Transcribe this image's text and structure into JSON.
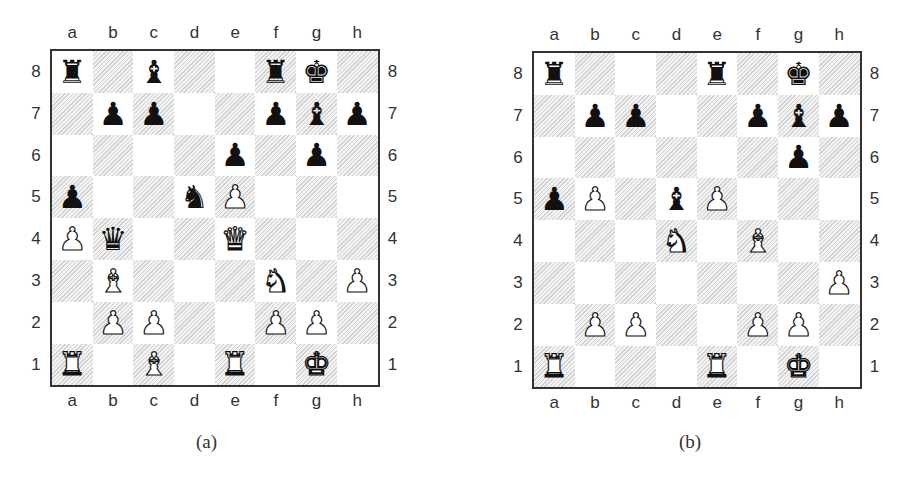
{
  "files": [
    "a",
    "b",
    "c",
    "d",
    "e",
    "f",
    "g",
    "h"
  ],
  "ranks": [
    "8",
    "7",
    "6",
    "5",
    "4",
    "3",
    "2",
    "1"
  ],
  "glyphs": {
    "K": "♚",
    "Q": "♛",
    "R": "♜",
    "B": "♝",
    "N": "♞",
    "P": "♟"
  },
  "diagrams": [
    {
      "caption": "(a)",
      "position": [
        [
          "bR",
          "",
          "bB",
          "",
          "",
          "bR",
          "bK",
          ""
        ],
        [
          "",
          "bP",
          "bP",
          "",
          "",
          "bP",
          "bB",
          "bP"
        ],
        [
          "",
          "",
          "",
          "",
          "bP",
          "",
          "bP",
          ""
        ],
        [
          "bP",
          "",
          "",
          "bN",
          "wP",
          "",
          "",
          ""
        ],
        [
          "wP",
          "bQ",
          "",
          "",
          "wQ",
          "",
          "",
          ""
        ],
        [
          "",
          "wB",
          "",
          "",
          "",
          "wN",
          "",
          "wP"
        ],
        [
          "",
          "wP",
          "wP",
          "",
          "",
          "wP",
          "wP",
          ""
        ],
        [
          "wR",
          "",
          "wB",
          "",
          "wR",
          "",
          "wK",
          ""
        ]
      ]
    },
    {
      "caption": "(b)",
      "position": [
        [
          "bR",
          "",
          "",
          "",
          "bR",
          "",
          "bK",
          ""
        ],
        [
          "",
          "bP",
          "bP",
          "",
          "",
          "bP",
          "bB",
          "bP"
        ],
        [
          "",
          "",
          "",
          "",
          "",
          "",
          "bP",
          ""
        ],
        [
          "bP",
          "wP",
          "",
          "bB",
          "wP",
          "",
          "",
          ""
        ],
        [
          "",
          "",
          "",
          "wN",
          "",
          "wB",
          "",
          ""
        ],
        [
          "",
          "",
          "",
          "",
          "",
          "",
          "",
          "wP"
        ],
        [
          "",
          "wP",
          "wP",
          "",
          "",
          "wP",
          "wP",
          ""
        ],
        [
          "wR",
          "",
          "",
          "",
          "wR",
          "",
          "wK",
          ""
        ]
      ]
    }
  ]
}
